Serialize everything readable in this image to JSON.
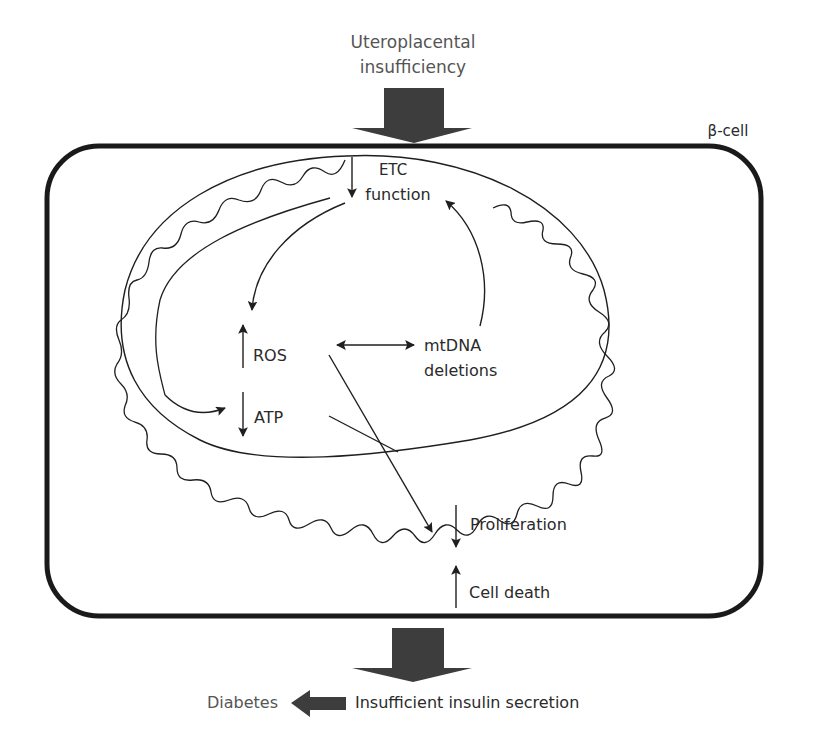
{
  "colors": {
    "stroke": "#1f1f1f",
    "block_arrow": "#3d3d3d",
    "text": "#2a2a2a",
    "text_secondary": "#555555",
    "background": "#ffffff"
  },
  "labels": {
    "cause_line1": "Uteroplacental",
    "cause_line2": "insufficiency",
    "cell": "β-cell",
    "etc_line1": "ETC",
    "etc_line2": "function",
    "ros": "ROS",
    "atp": "ATP",
    "mtdna_line1": "mtDNA",
    "mtdna_line2": "deletions",
    "proliferation": "Proliferation",
    "cell_death": "Cell death",
    "outcome": "Insufficient insulin secretion",
    "diabetes": "Diabetes"
  },
  "indicators": {
    "etc": "down",
    "ros": "up",
    "atp": "down",
    "proliferation": "down",
    "cell_death": "up"
  },
  "icons": {
    "top_arrow": "block-arrow-down-icon",
    "bottom_arrow": "block-arrow-down-icon",
    "diabetes_arrow": "block-arrow-left-icon",
    "double_arrow": "double-headed-arrow-icon"
  }
}
